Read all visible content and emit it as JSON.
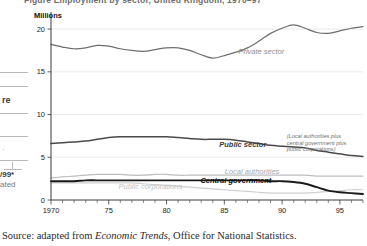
{
  "page": {
    "clipped_heading": "Figure   Employment by sector, United Kingdom, 1970–97",
    "source_prefix": "Source: adapted from ",
    "source_italic": "Economic Trends",
    "source_suffix": ", Office for National Statistics.",
    "margin_fragments": [
      {
        "text": "re",
        "x": 2,
        "y": 101
      },
      {
        "text": "/99*",
        "x": 1,
        "y": 173
      },
      {
        "text": "ated",
        "x": 1,
        "y": 183
      }
    ]
  },
  "chart_data": {
    "type": "line",
    "title": "Employment by sector, United Kingdom",
    "xlabel": "",
    "ylabel": "Millions",
    "ylim": [
      0,
      22
    ],
    "xlim": [
      1970,
      1997
    ],
    "yticks": [
      0,
      5,
      10,
      15,
      20
    ],
    "ytick_labels": [
      "0",
      "5",
      "10",
      "15",
      "20"
    ],
    "xticks": [
      1970,
      1975,
      1980,
      1985,
      1990,
      1995
    ],
    "xtick_labels": [
      "1970",
      "75",
      "80",
      "85",
      "90",
      "95"
    ],
    "minor_xticks_every": 1,
    "grid": "horizontal",
    "legend": "inline-annotations",
    "annotations": [
      {
        "name": "private-sector",
        "text": "Private sector",
        "x": 1988.2,
        "y": 17.1
      },
      {
        "name": "public-sector",
        "text": "Public sector",
        "x": 1986.6,
        "y": 6.2
      },
      {
        "name": "public-sector-note",
        "text": "(Local authorities plus central government plus public corporations)",
        "lines": [
          "(Local authorities plus",
          "central government plus",
          "public corporations)"
        ],
        "x": 1990.4,
        "y": 7.2
      },
      {
        "name": "local-authorities",
        "text": "Local authorities",
        "x": 1987.4,
        "y": 3.1
      },
      {
        "name": "public-corporations",
        "text": "Public corporations",
        "x": 1978.6,
        "y": 1.25
      },
      {
        "name": "central-government",
        "text": "Central government",
        "x": 1986.0,
        "y": 1.95
      }
    ],
    "x": [
      1970,
      1971,
      1972,
      1973,
      1974,
      1975,
      1976,
      1977,
      1978,
      1979,
      1980,
      1981,
      1982,
      1983,
      1984,
      1985,
      1986,
      1987,
      1988,
      1989,
      1990,
      1991,
      1992,
      1993,
      1994,
      1995,
      1996,
      1997
    ],
    "series": [
      {
        "name": "Private sector",
        "color": "#6e6e6e",
        "values": [
          18.2,
          17.9,
          17.7,
          17.8,
          18.1,
          18.0,
          17.7,
          17.5,
          17.4,
          17.6,
          17.8,
          17.8,
          17.5,
          17.0,
          16.6,
          16.9,
          17.3,
          17.8,
          18.6,
          19.5,
          20.1,
          20.5,
          20.1,
          19.6,
          19.5,
          19.8,
          20.1,
          20.3
        ]
      },
      {
        "name": "Public sector",
        "color": "#4a4a4a",
        "values": [
          6.6,
          6.7,
          6.8,
          6.9,
          7.1,
          7.3,
          7.4,
          7.4,
          7.4,
          7.4,
          7.4,
          7.3,
          7.2,
          7.1,
          7.1,
          7.1,
          7.0,
          6.8,
          6.6,
          6.4,
          6.3,
          6.2,
          6.1,
          5.8,
          5.6,
          5.4,
          5.2,
          5.1
        ]
      },
      {
        "name": "Local authorities",
        "color": "#bdbdbd",
        "values": [
          2.6,
          2.7,
          2.8,
          2.9,
          3.0,
          3.0,
          3.0,
          2.9,
          2.9,
          3.0,
          3.0,
          2.9,
          2.9,
          2.9,
          2.9,
          2.9,
          2.9,
          2.9,
          2.9,
          2.9,
          2.9,
          2.9,
          2.9,
          2.8,
          2.8,
          2.8,
          2.8,
          2.8
        ]
      },
      {
        "name": "Central government",
        "color": "#1a1a1a",
        "values": [
          2.2,
          2.2,
          2.2,
          2.3,
          2.3,
          2.3,
          2.3,
          2.3,
          2.3,
          2.3,
          2.3,
          2.3,
          2.3,
          2.3,
          2.3,
          2.3,
          2.3,
          2.3,
          2.3,
          2.2,
          2.2,
          2.1,
          1.9,
          1.5,
          1.1,
          0.9,
          0.8,
          0.7
        ]
      },
      {
        "name": "Public corporations",
        "color": "#cfcfcf",
        "values": [
          2.0,
          2.0,
          2.0,
          2.0,
          2.0,
          2.0,
          2.0,
          2.0,
          1.9,
          1.8,
          1.7,
          1.6,
          1.5,
          1.4,
          1.3,
          1.2,
          1.1,
          1.0,
          0.9,
          0.8,
          0.8,
          0.8,
          0.8,
          0.9,
          1.0,
          1.1,
          1.2,
          1.2
        ]
      }
    ]
  }
}
